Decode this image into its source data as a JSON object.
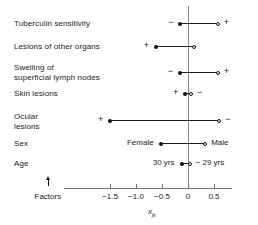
{
  "chart_data": {
    "type": "dot",
    "title": "",
    "xlabel": "x_jk",
    "xlabel_base": "x",
    "xlabel_sub": "jk",
    "ylabel": "Factors",
    "grid": false,
    "legend": null,
    "xlim": [
      -1.78,
      0.68
    ],
    "xticks": [
      -1.5,
      -1.0,
      -0.5,
      0,
      0.5
    ],
    "xticklabels": [
      "−1.5",
      "−1.0",
      "−0.5",
      "0",
      "0.5"
    ],
    "zero_reference": 0,
    "rows": [
      {
        "label": "Tuberculin sensitivity",
        "left_label": "−",
        "right_label": "+",
        "filled_value": -0.15,
        "open_value": 0.57
      },
      {
        "label": "Lesions of other organs",
        "left_label": "+",
        "right_label": "",
        "filled_value": -0.62,
        "open_value": 0.11
      },
      {
        "label": "Swelling of\nsuperficial lymph nodes",
        "left_label": "−",
        "right_label": "+",
        "filled_value": -0.16,
        "open_value": 0.57
      },
      {
        "label": "Skin lesions",
        "left_label": "+",
        "right_label": "−",
        "filled_value": -0.06,
        "open_value": 0.06
      },
      {
        "label": "Ocular\nlesions",
        "left_label": "+",
        "right_label": "−",
        "filled_value": -1.5,
        "open_value": 0.6
      },
      {
        "label": "Sex",
        "left_label": "Female",
        "right_label": "Male",
        "filled_value": -0.52,
        "open_value": 0.33
      },
      {
        "label": "Age",
        "left_label": "30 yrs",
        "right_label": "− 29 yrs",
        "filled_value": -0.12,
        "open_value": 0.03
      }
    ]
  },
  "axis": {
    "y_axis_caption": "Factors",
    "x_axis_caption_base": "x",
    "x_axis_caption_sub": "jk"
  },
  "colors": {
    "ink": "#1a1a1a",
    "axis": "#6f6f6f",
    "zero_line": "#8a8a8a",
    "background": "#ffffff"
  }
}
